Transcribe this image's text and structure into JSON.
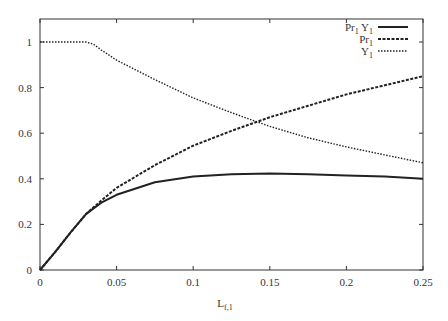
{
  "chart_data": {
    "type": "line",
    "title": "",
    "xlabel": "L_f,1",
    "ylabel": "",
    "xlim": [
      0,
      0.25
    ],
    "ylim": [
      0,
      1.1
    ],
    "grid": false,
    "legend_position": "top-right",
    "x_ticks": [
      "0",
      "0.05",
      "0.1",
      "0.15",
      "0.2",
      "0.25"
    ],
    "y_ticks": [
      "0",
      "0.2",
      "0.4",
      "0.6",
      "0.8",
      "1"
    ],
    "x": [
      0,
      0.01,
      0.02,
      0.03,
      0.035,
      0.04,
      0.05,
      0.075,
      0.1,
      0.125,
      0.15,
      0.175,
      0.2,
      0.225,
      0.25
    ],
    "series": [
      {
        "name": "Pr1 Y1",
        "style": "solid",
        "values": [
          0,
          0.08,
          0.165,
          0.245,
          0.27,
          0.295,
          0.33,
          0.385,
          0.41,
          0.42,
          0.423,
          0.42,
          0.415,
          0.41,
          0.4
        ]
      },
      {
        "name": "Pr1",
        "style": "dashed",
        "values": [
          0,
          0.08,
          0.165,
          0.245,
          0.275,
          0.305,
          0.36,
          0.46,
          0.545,
          0.61,
          0.67,
          0.72,
          0.77,
          0.81,
          0.85
        ]
      },
      {
        "name": "Y1",
        "style": "dotted",
        "values": [
          1,
          1,
          1,
          1,
          0.99,
          0.965,
          0.92,
          0.835,
          0.755,
          0.69,
          0.63,
          0.58,
          0.54,
          0.505,
          0.47
        ]
      }
    ]
  },
  "legend": {
    "items": [
      {
        "label_main": "Pr",
        "label_sub": "1",
        "label_main2": " Y",
        "label_sub2": "1"
      },
      {
        "label_main": "Pr",
        "label_sub": "1"
      },
      {
        "label_main": "Y",
        "label_sub": "1"
      }
    ]
  },
  "axis": {
    "xlabel_main": "L",
    "xlabel_sub": "f,1"
  }
}
